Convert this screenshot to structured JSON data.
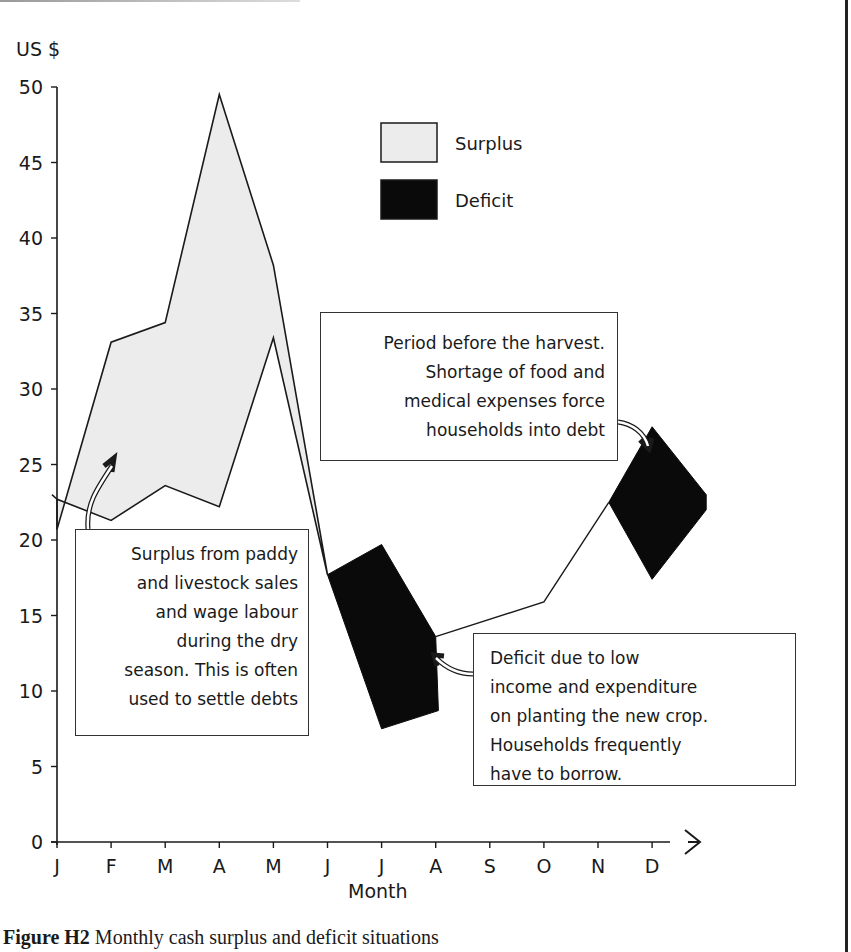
{
  "chart_data": {
    "type": "area",
    "title": "Monthly cash surplus and deficit situations",
    "figure_label": "Figure H2",
    "xlabel": "Month",
    "ylabel": "US $",
    "ylim": [
      0,
      50
    ],
    "y_ticks": [
      0,
      5,
      10,
      15,
      20,
      25,
      30,
      35,
      40,
      45,
      50
    ],
    "categories": [
      "J",
      "F",
      "M",
      "A",
      "M",
      "J",
      "J",
      "A",
      "S",
      "O",
      "N",
      "D"
    ],
    "grid": false,
    "legend_position": "top-center",
    "legend": [
      {
        "name": "Surplus",
        "fill": "#ececec"
      },
      {
        "name": "Deficit",
        "fill": "#0a0a0a"
      }
    ],
    "series": [
      {
        "name": "Income",
        "values": [
          20.7,
          33.1,
          34.4,
          49.5,
          38.2,
          17.7,
          7.5,
          8.7,
          null,
          15.9,
          22.5,
          22.0
        ]
      },
      {
        "name": "Expenditure",
        "values": [
          22.7,
          21.3,
          23.6,
          22.2,
          33.4,
          17.7,
          19.7,
          13.6,
          null,
          15.9,
          22.5,
          23.0
        ]
      }
    ],
    "surplus_region": {
      "upper": [
        [
          0,
          20.7
        ],
        [
          1,
          33.1
        ],
        [
          2,
          34.4
        ],
        [
          3,
          49.5
        ],
        [
          4,
          38.2
        ],
        [
          5,
          17.7
        ]
      ],
      "lower": [
        [
          0,
          22.7
        ],
        [
          1,
          21.3
        ],
        [
          2,
          23.6
        ],
        [
          3,
          22.2
        ],
        [
          4,
          33.4
        ],
        [
          5,
          17.7
        ]
      ]
    },
    "deficit_regions": [
      {
        "polygon": [
          [
            5,
            17.7
          ],
          [
            6,
            19.7
          ],
          [
            7,
            13.6
          ],
          [
            7.05,
            8.7
          ],
          [
            6,
            7.5
          ]
        ]
      },
      {
        "polygon": [
          [
            10.2,
            22.5
          ],
          [
            11,
            27.5
          ],
          [
            12.0,
            23.0
          ],
          [
            12.0,
            22.0
          ],
          [
            11,
            17.4
          ]
        ]
      }
    ],
    "connector_line": [
      [
        7,
        13.6
      ],
      [
        9,
        15.9
      ],
      [
        10.2,
        22.5
      ]
    ],
    "annotations": [
      {
        "id": "surplus",
        "lines": [
          "Surplus from paddy",
          "and livestock  sales",
          "and  wage  labour",
          "during  the  dry",
          "season. This is often",
          "used to settle debts"
        ]
      },
      {
        "id": "harvest",
        "lines": [
          "Period before the harvest.",
          "Shortage  of  food  and",
          "medical  expenses  force",
          "households  into  debt"
        ]
      },
      {
        "id": "deficit",
        "lines": [
          "Deficit  due  to  low",
          "income  and   expenditure",
          "on  planting  the  new  crop.",
          "Households  frequently",
          "have to borrow."
        ]
      }
    ]
  },
  "caption": {
    "label": "Figure H2",
    "text": " Monthly cash surplus and deficit situations"
  },
  "layout": {
    "x0": 57,
    "dx": 54.1,
    "y0": 842,
    "py": 15.1,
    "colors": {
      "surplus": "#ececec",
      "deficit": "#0a0a0a",
      "line": "#1a1a1a"
    }
  }
}
